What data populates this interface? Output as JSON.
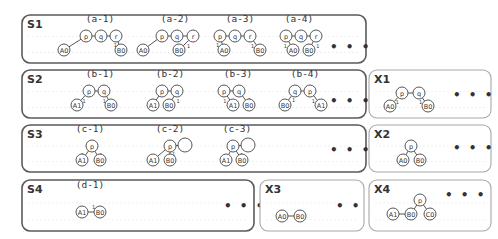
{
  "boxes": [
    {
      "id": "S1",
      "label": "S1",
      "style": "dark",
      "x": 22,
      "y": 15,
      "w": 344,
      "h": 48,
      "label_x": 27,
      "label_y": 28,
      "dots": {
        "x": 330,
        "y": 51
      },
      "graphs": [
        {
          "caption": "(a-1)",
          "cx": 100,
          "cy": 22,
          "nodes": [
            {
              "id": "p",
              "t": "p",
              "x": 86,
              "y": 36
            },
            {
              "id": "q",
              "t": "q",
              "x": 101,
              "y": 36
            },
            {
              "id": "r",
              "t": "r",
              "x": 116,
              "y": 36
            },
            {
              "id": "A0",
              "t": "A0",
              "x": 64,
              "y": 50
            },
            {
              "id": "B0",
              "t": "B0",
              "x": 121,
              "y": 50
            }
          ],
          "edges": [
            [
              "p",
              "q"
            ],
            [
              "q",
              "r"
            ],
            [
              "p",
              "A0",
              "1",
              -5,
              4
            ],
            [
              "r",
              "B0",
              "1",
              -5,
              4
            ]
          ]
        },
        {
          "caption": "(a-2)",
          "cx": 175,
          "cy": 22,
          "nodes": [
            {
              "id": "p",
              "t": "p",
              "x": 162,
              "y": 36
            },
            {
              "id": "q",
              "t": "q",
              "x": 177,
              "y": 36
            },
            {
              "id": "r",
              "t": "r",
              "x": 193,
              "y": 36
            },
            {
              "id": "A0",
              "t": "A0",
              "x": 143,
              "y": 50
            },
            {
              "id": "B0",
              "t": "B0",
              "x": 179,
              "y": 50
            }
          ],
          "edges": [
            [
              "p",
              "q"
            ],
            [
              "q",
              "r"
            ],
            [
              "p",
              "A0",
              "1",
              -5,
              4
            ],
            [
              "r",
              "B0",
              "1",
              3,
              3
            ]
          ]
        },
        {
          "caption": "(a-3)",
          "cx": 240,
          "cy": 22,
          "nodes": [
            {
              "id": "p",
              "t": "p",
              "x": 220,
              "y": 36
            },
            {
              "id": "q",
              "t": "q",
              "x": 235,
              "y": 36
            },
            {
              "id": "r",
              "t": "r",
              "x": 250,
              "y": 36
            },
            {
              "id": "A0",
              "t": "A0",
              "x": 224,
              "y": 50
            },
            {
              "id": "B0",
              "t": "B0",
              "x": 260,
              "y": 50
            }
          ],
          "edges": [
            [
              "p",
              "q"
            ],
            [
              "q",
              "r"
            ],
            [
              "p",
              "A0",
              "1",
              -6,
              4
            ],
            [
              "r",
              "B0",
              "1",
              -5,
              4
            ]
          ]
        },
        {
          "caption": "(a-4)",
          "cx": 299,
          "cy": 22,
          "nodes": [
            {
              "id": "p",
              "t": "p",
              "x": 286,
              "y": 36
            },
            {
              "id": "q",
              "t": "q",
              "x": 301,
              "y": 36
            },
            {
              "id": "r",
              "t": "r",
              "x": 316,
              "y": 36
            },
            {
              "id": "A0",
              "t": "A0",
              "x": 293,
              "y": 50
            },
            {
              "id": "B0",
              "t": "B0",
              "x": 309,
              "y": 50
            }
          ],
          "edges": [
            [
              "p",
              "q"
            ],
            [
              "q",
              "r"
            ],
            [
              "p",
              "A0",
              "1",
              -6,
              4
            ],
            [
              "r",
              "B0",
              "1",
              4,
              4
            ]
          ]
        }
      ]
    },
    {
      "id": "S2",
      "label": "S2",
      "style": "dark",
      "x": 22,
      "y": 70,
      "w": 344,
      "h": 48,
      "label_x": 27,
      "label_y": 83,
      "dots": {
        "x": 330,
        "y": 105
      },
      "graphs": [
        {
          "caption": "(b-1)",
          "cx": 100,
          "cy": 77,
          "nodes": [
            {
              "id": "p",
              "t": "p",
              "x": 89,
              "y": 91
            },
            {
              "id": "q",
              "t": "q",
              "x": 104,
              "y": 91
            },
            {
              "id": "A1",
              "t": "A1",
              "x": 77,
              "y": 105
            },
            {
              "id": "B0",
              "t": "B0",
              "x": 111,
              "y": 105
            }
          ],
          "edges": [
            [
              "p",
              "q"
            ],
            [
              "p",
              "A1",
              "1",
              1,
              3
            ],
            [
              "q",
              "B0",
              "1",
              -5,
              4
            ]
          ]
        },
        {
          "caption": "(b-2)",
          "cx": 170,
          "cy": 77,
          "nodes": [
            {
              "id": "p",
              "t": "p",
              "x": 162,
              "y": 91
            },
            {
              "id": "q",
              "t": "q",
              "x": 177,
              "y": 91
            },
            {
              "id": "A1",
              "t": "A1",
              "x": 153,
              "y": 105
            },
            {
              "id": "B0",
              "t": "B0",
              "x": 169,
              "y": 105
            }
          ],
          "edges": [
            [
              "p",
              "q"
            ],
            [
              "p",
              "A1",
              "1",
              -6,
              4
            ],
            [
              "q",
              "B0",
              "1",
              4,
              4
            ]
          ]
        },
        {
          "caption": "(b-3)",
          "cx": 238,
          "cy": 77,
          "nodes": [
            {
              "id": "p",
              "t": "p",
              "x": 224,
              "y": 91
            },
            {
              "id": "q",
              "t": "q",
              "x": 239,
              "y": 91
            },
            {
              "id": "A1",
              "t": "A1",
              "x": 233,
              "y": 105
            },
            {
              "id": "B0",
              "t": "B0",
              "x": 249,
              "y": 105
            }
          ],
          "edges": [
            [
              "p",
              "q"
            ],
            [
              "p",
              "A1",
              "1",
              -6,
              4
            ],
            [
              "q",
              "B0",
              "1",
              3,
              3
            ]
          ]
        },
        {
          "caption": "(b-4)",
          "cx": 305,
          "cy": 77,
          "nodes": [
            {
              "id": "q",
              "t": "q",
              "x": 295,
              "y": 91
            },
            {
              "id": "p",
              "t": "p",
              "x": 310,
              "y": 91
            },
            {
              "id": "B0",
              "t": "B0",
              "x": 285,
              "y": 105
            },
            {
              "id": "A1",
              "t": "A1",
              "x": 321,
              "y": 105
            }
          ],
          "edges": [
            [
              "q",
              "p"
            ],
            [
              "q",
              "B0",
              "1",
              3,
              3
            ],
            [
              "p",
              "A1",
              "1",
              -5,
              4
            ]
          ]
        }
      ]
    },
    {
      "id": "X1",
      "label": "X1",
      "style": "light",
      "x": 369,
      "y": 70,
      "w": 122,
      "h": 48,
      "label_x": 374,
      "label_y": 83,
      "dots": {
        "x": 453,
        "y": 99
      },
      "graphs": [
        {
          "caption": "",
          "cx": 0,
          "cy": 0,
          "nodes": [
            {
              "id": "p",
              "t": "p",
              "x": 402,
              "y": 93
            },
            {
              "id": "q",
              "t": "q",
              "x": 419,
              "y": 93
            },
            {
              "id": "A0",
              "t": "A0",
              "x": 390,
              "y": 106
            },
            {
              "id": "B0",
              "t": "B0",
              "x": 428,
              "y": 106
            }
          ],
          "edges": [
            [
              "p",
              "q"
            ],
            [
              "p",
              "A0",
              "1",
              1,
              3
            ],
            [
              "q",
              "B0",
              "1",
              -5,
              4
            ]
          ]
        }
      ]
    },
    {
      "id": "S3",
      "label": "S3",
      "style": "dark",
      "x": 22,
      "y": 125,
      "w": 344,
      "h": 47,
      "label_x": 27,
      "label_y": 138,
      "dots": {
        "x": 330,
        "y": 154
      },
      "graphs": [
        {
          "caption": "(c-1)",
          "cx": 90,
          "cy": 132,
          "nodes": [
            {
              "id": "p",
              "t": "p",
              "x": 92,
              "y": 146
            },
            {
              "id": "A1",
              "t": "A1",
              "x": 82,
              "y": 160
            },
            {
              "id": "B0",
              "t": "B0",
              "x": 100,
              "y": 160
            }
          ],
          "edges": [
            [
              "p",
              "A1",
              "1",
              -5,
              3
            ],
            [
              "p",
              "B0",
              "1",
              3,
              3
            ]
          ]
        },
        {
          "caption": "(c-2)",
          "cx": 170,
          "cy": 132,
          "nodes": [
            {
              "id": "p",
              "t": "p",
              "x": 170,
              "y": 146
            },
            {
              "id": "e",
              "t": "",
              "x": 185,
              "y": 145,
              "big": true
            },
            {
              "id": "A1",
              "t": "A1",
              "x": 153,
              "y": 160
            },
            {
              "id": "B0",
              "t": "B0",
              "x": 170,
              "y": 160
            }
          ],
          "edges": [
            [
              "p",
              "e"
            ],
            [
              "p",
              "A1",
              "1",
              -6,
              4
            ],
            [
              "p",
              "B0",
              "1",
              2,
              3
            ]
          ]
        },
        {
          "caption": "(c-3)",
          "cx": 237,
          "cy": 132,
          "nodes": [
            {
              "id": "p",
              "t": "p",
              "x": 233,
              "y": 146
            },
            {
              "id": "e",
              "t": "",
              "x": 248,
              "y": 145,
              "big": true
            },
            {
              "id": "A1",
              "t": "A1",
              "x": 226,
              "y": 160
            },
            {
              "id": "B0",
              "t": "B0",
              "x": 242,
              "y": 160
            }
          ],
          "edges": [
            [
              "p",
              "e"
            ],
            [
              "p",
              "A1",
              "1",
              -6,
              4
            ],
            [
              "p",
              "B0",
              "1",
              2,
              3
            ]
          ]
        }
      ]
    },
    {
      "id": "X2",
      "label": "X2",
      "style": "light",
      "x": 369,
      "y": 125,
      "w": 122,
      "h": 47,
      "label_x": 374,
      "label_y": 138,
      "dots": {
        "x": 453,
        "y": 152
      },
      "graphs": [
        {
          "caption": "",
          "cx": 0,
          "cy": 0,
          "nodes": [
            {
              "id": "p",
              "t": "p",
              "x": 411,
              "y": 146
            },
            {
              "id": "A0",
              "t": "A0",
              "x": 403,
              "y": 160
            },
            {
              "id": "B0",
              "t": "B0",
              "x": 420,
              "y": 160
            }
          ],
          "edges": [
            [
              "p",
              "A0"
            ],
            [
              "p",
              "B0"
            ]
          ]
        }
      ]
    },
    {
      "id": "S4",
      "label": "S4",
      "style": "dark",
      "x": 22,
      "y": 180,
      "w": 232,
      "h": 51,
      "label_x": 27,
      "label_y": 193,
      "dots": {
        "x": 224,
        "y": 210
      },
      "graphs": [
        {
          "caption": "(d-1)",
          "cx": 90,
          "cy": 188,
          "nodes": [
            {
              "id": "A1",
              "t": "A1",
              "x": 82,
              "y": 212
            },
            {
              "id": "B0",
              "t": "B0",
              "x": 100,
              "y": 212
            }
          ],
          "edges": [
            [
              "A1",
              "B0",
              "1",
              -1,
              -3
            ]
          ]
        }
      ]
    },
    {
      "id": "X3",
      "label": "X3",
      "style": "light",
      "x": 260,
      "y": 180,
      "w": 104,
      "h": 51,
      "label_x": 265,
      "label_y": 193,
      "dots": {
        "x": 336,
        "y": 210
      },
      "graphs": [
        {
          "caption": "",
          "cx": 0,
          "cy": 0,
          "nodes": [
            {
              "id": "A0",
              "t": "A0",
              "x": 282,
              "y": 216
            },
            {
              "id": "B0",
              "t": "B0",
              "x": 300,
              "y": 216
            }
          ],
          "edges": [
            [
              "A0",
              "B0"
            ]
          ]
        }
      ]
    },
    {
      "id": "X4",
      "label": "X4",
      "style": "light",
      "x": 369,
      "y": 180,
      "w": 122,
      "h": 51,
      "label_x": 374,
      "label_y": 193,
      "dots": {
        "x": 445,
        "y": 199
      },
      "graphs": [
        {
          "caption": "",
          "cx": 0,
          "cy": 0,
          "nodes": [
            {
              "id": "p",
              "t": "p",
              "x": 420,
              "y": 200
            },
            {
              "id": "A1",
              "t": "A1",
              "x": 393,
              "y": 214
            },
            {
              "id": "B0",
              "t": "B0",
              "x": 411,
              "y": 214
            },
            {
              "id": "C0",
              "t": "C0",
              "x": 430,
              "y": 214
            }
          ],
          "edges": [
            [
              "A1",
              "B0"
            ],
            [
              "p",
              "B0"
            ],
            [
              "p",
              "C0"
            ]
          ]
        }
      ]
    }
  ],
  "ellipsis": "• • •",
  "colors": {
    "dark_border": "#5a5a5a",
    "light_border": "#a8a8a8",
    "node_stroke": "#444444",
    "text": "#333333"
  }
}
